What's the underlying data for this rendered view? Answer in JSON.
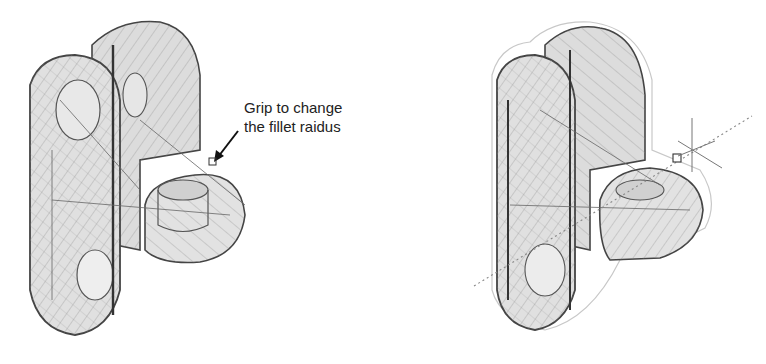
{
  "figure": {
    "left_view": {
      "name": "wireframe-model-before",
      "annotation": {
        "line1": "Grip to change",
        "line2": "the fillet raidus"
      }
    },
    "right_view": {
      "name": "wireframe-model-dragging-grip"
    },
    "colors": {
      "background": "#ffffff",
      "wire": "#555555",
      "fill": "#d9d9d9",
      "text": "#222222"
    }
  }
}
